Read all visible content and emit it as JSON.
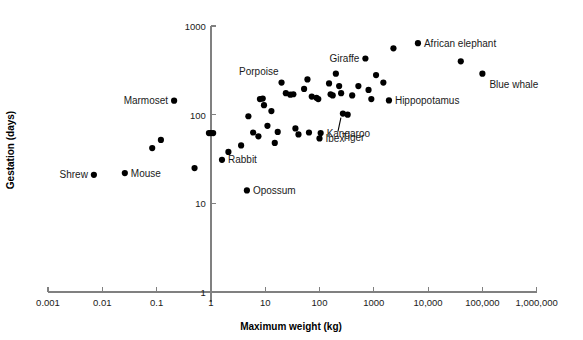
{
  "chart_data": {
    "type": "scatter",
    "title": "",
    "xlabel": "Maximum weight (kg)",
    "ylabel": "Gestation (days)",
    "xscale": "log",
    "yscale": "log",
    "xlim": [
      0.001,
      1000000
    ],
    "ylim": [
      1,
      1000
    ],
    "grid": false,
    "legend": null,
    "xticks": [
      {
        "value": 0.001,
        "label": "0.001"
      },
      {
        "value": 0.01,
        "label": "0.01"
      },
      {
        "value": 0.1,
        "label": "0.1"
      },
      {
        "value": 1,
        "label": "1"
      },
      {
        "value": 10,
        "label": "10"
      },
      {
        "value": 100,
        "label": "100"
      },
      {
        "value": 1000,
        "label": "1000"
      },
      {
        "value": 10000,
        "label": "10,000"
      },
      {
        "value": 100000,
        "label": "100,000"
      },
      {
        "value": 1000000,
        "label": "1,000,000"
      }
    ],
    "yticks": [
      {
        "value": 1,
        "label": "1"
      },
      {
        "value": 10,
        "label": "10"
      },
      {
        "value": 100,
        "label": "100"
      },
      {
        "value": 1000,
        "label": "1000"
      }
    ],
    "marker_color": "#000000",
    "axis_color": "#808080",
    "points": [
      {
        "x": 0.007,
        "y": 21,
        "label": "Shrew",
        "label_pos": "left"
      },
      {
        "x": 0.026,
        "y": 22,
        "label": "Mouse",
        "label_pos": "right"
      },
      {
        "x": 0.083,
        "y": 42,
        "label": "",
        "label_pos": ""
      },
      {
        "x": 0.12,
        "y": 52,
        "label": "",
        "label_pos": ""
      },
      {
        "x": 0.21,
        "y": 144,
        "label": "Marmoset",
        "label_pos": "left"
      },
      {
        "x": 0.5,
        "y": 25,
        "label": "",
        "label_pos": ""
      },
      {
        "x": 0.92,
        "y": 62,
        "label": "",
        "label_pos": ""
      },
      {
        "x": 1.0,
        "y": 62,
        "label": "",
        "label_pos": ""
      },
      {
        "x": 1.1,
        "y": 62,
        "label": "",
        "label_pos": ""
      },
      {
        "x": 1.6,
        "y": 31,
        "label": "Rabbit",
        "label_pos": "right"
      },
      {
        "x": 2.1,
        "y": 38,
        "label": "",
        "label_pos": ""
      },
      {
        "x": 4.6,
        "y": 14,
        "label": "Opossum",
        "label_pos": "right"
      },
      {
        "x": 3.6,
        "y": 45,
        "label": "",
        "label_pos": ""
      },
      {
        "x": 4.9,
        "y": 96,
        "label": "",
        "label_pos": ""
      },
      {
        "x": 6.0,
        "y": 63,
        "label": "",
        "label_pos": ""
      },
      {
        "x": 7.5,
        "y": 57,
        "label": "",
        "label_pos": ""
      },
      {
        "x": 8.0,
        "y": 150,
        "label": "",
        "label_pos": ""
      },
      {
        "x": 9.0,
        "y": 152,
        "label": "",
        "label_pos": ""
      },
      {
        "x": 9.5,
        "y": 128,
        "label": "",
        "label_pos": ""
      },
      {
        "x": 11,
        "y": 75,
        "label": "",
        "label_pos": ""
      },
      {
        "x": 13,
        "y": 110,
        "label": "",
        "label_pos": ""
      },
      {
        "x": 15,
        "y": 48,
        "label": "",
        "label_pos": ""
      },
      {
        "x": 17,
        "y": 64,
        "label": "",
        "label_pos": ""
      },
      {
        "x": 20,
        "y": 230,
        "label": "Porpoise",
        "label_pos": "above-left"
      },
      {
        "x": 24,
        "y": 175,
        "label": "",
        "label_pos": ""
      },
      {
        "x": 29,
        "y": 168,
        "label": "",
        "label_pos": ""
      },
      {
        "x": 33,
        "y": 170,
        "label": "",
        "label_pos": ""
      },
      {
        "x": 36,
        "y": 70,
        "label": "",
        "label_pos": ""
      },
      {
        "x": 41,
        "y": 60,
        "label": "",
        "label_pos": ""
      },
      {
        "x": 52,
        "y": 195,
        "label": "",
        "label_pos": ""
      },
      {
        "x": 60,
        "y": 250,
        "label": "",
        "label_pos": ""
      },
      {
        "x": 64,
        "y": 63,
        "label": "",
        "label_pos": ""
      },
      {
        "x": 72,
        "y": 160,
        "label": "",
        "label_pos": ""
      },
      {
        "x": 88,
        "y": 155,
        "label": "",
        "label_pos": ""
      },
      {
        "x": 95,
        "y": 150,
        "label": "",
        "label_pos": ""
      },
      {
        "x": 100,
        "y": 54,
        "label": "Ibex",
        "label_pos": "right"
      },
      {
        "x": 105,
        "y": 62,
        "label": "Kangaroo",
        "label_pos": "right"
      },
      {
        "x": 150,
        "y": 225,
        "label": "",
        "label_pos": ""
      },
      {
        "x": 160,
        "y": 170,
        "label": "",
        "label_pos": ""
      },
      {
        "x": 175,
        "y": 165,
        "label": "",
        "label_pos": ""
      },
      {
        "x": 200,
        "y": 290,
        "label": "",
        "label_pos": ""
      },
      {
        "x": 230,
        "y": 210,
        "label": "",
        "label_pos": ""
      },
      {
        "x": 250,
        "y": 175,
        "label": "",
        "label_pos": ""
      },
      {
        "x": 270,
        "y": 103,
        "label": "Tiger",
        "label_pos": "leader"
      },
      {
        "x": 330,
        "y": 100,
        "label": "",
        "label_pos": ""
      },
      {
        "x": 400,
        "y": 165,
        "label": "",
        "label_pos": ""
      },
      {
        "x": 520,
        "y": 210,
        "label": "",
        "label_pos": ""
      },
      {
        "x": 700,
        "y": 430,
        "label": "Giraffe",
        "label_pos": "left"
      },
      {
        "x": 800,
        "y": 190,
        "label": "",
        "label_pos": ""
      },
      {
        "x": 900,
        "y": 150,
        "label": "",
        "label_pos": ""
      },
      {
        "x": 1100,
        "y": 280,
        "label": "",
        "label_pos": ""
      },
      {
        "x": 1500,
        "y": 230,
        "label": "",
        "label_pos": ""
      },
      {
        "x": 1900,
        "y": 145,
        "label": "Hippopotamus",
        "label_pos": "right"
      },
      {
        "x": 2300,
        "y": 560,
        "label": "",
        "label_pos": ""
      },
      {
        "x": 6500,
        "y": 640,
        "label": "African elephant",
        "label_pos": "right"
      },
      {
        "x": 40000,
        "y": 400,
        "label": "",
        "label_pos": ""
      },
      {
        "x": 100000,
        "y": 290,
        "label": "Blue whale",
        "label_pos": "below-right"
      }
    ]
  },
  "annotations": {
    "tiger_leader": "leader-line"
  }
}
